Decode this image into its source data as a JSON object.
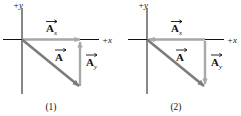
{
  "figure": {
    "kind": "vector-component-diagram-pair",
    "background_color": "#ffffff",
    "panels": [
      {
        "caption": "(1)",
        "axis_y_label": "+y",
        "axis_x_label": "+x",
        "axis_color": "#111111",
        "vectors": [
          {
            "name": "A_x",
            "label_base": "A",
            "label_subscript": "x",
            "color": "#a8a8a8",
            "orientation": "horizontal",
            "direction": "right",
            "arrowhead_at": "right-end-away-from-origin"
          },
          {
            "name": "A_y",
            "label_base": "A",
            "label_subscript": "y",
            "color": "#a8a8a8",
            "orientation": "vertical",
            "direction": "up",
            "arrowhead_at": "top-end"
          },
          {
            "name": "A",
            "label_base": "A",
            "label_subscript": "",
            "color": "#7c7c7c",
            "orientation": "diagonal",
            "direction": "down-right",
            "arrowhead_at": "lower-right-end"
          }
        ]
      },
      {
        "caption": "(2)",
        "axis_y_label": "+y",
        "axis_x_label": "+x",
        "axis_color": "#111111",
        "vectors": [
          {
            "name": "A_x",
            "label_base": "A",
            "label_subscript": "x",
            "color": "#a8a8a8",
            "orientation": "horizontal",
            "direction": "left",
            "arrowhead_at": "left-end-at-origin"
          },
          {
            "name": "A_y",
            "label_base": "A",
            "label_subscript": "y",
            "color": "#a8a8a8",
            "orientation": "vertical",
            "direction": "down",
            "arrowhead_at": "bottom-end"
          },
          {
            "name": "A",
            "label_base": "A",
            "label_subscript": "",
            "color": "#7c7c7c",
            "orientation": "diagonal",
            "direction": "down-right",
            "arrowhead_at": "lower-right-end"
          }
        ]
      }
    ]
  }
}
